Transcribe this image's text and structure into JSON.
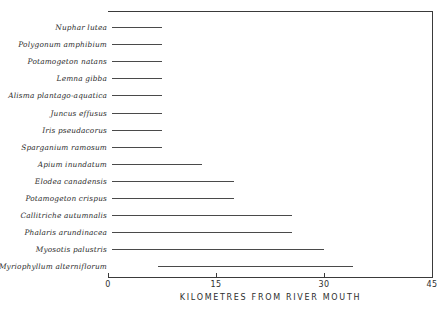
{
  "chart_data": {
    "type": "bar",
    "orientation": "horizontal",
    "title": "",
    "subtitle": "",
    "xlabel": "KILOMETRES FROM RIVER MOUTH",
    "ylabel": "",
    "xlim": [
      0,
      48
    ],
    "xticks": [
      0,
      15,
      30,
      45
    ],
    "xticklabels": [
      "0",
      "15",
      "30",
      "45"
    ],
    "grid": false,
    "legend": null,
    "bar_color": "#4a4a4a",
    "axis_color": "#3a3a3a",
    "note": "Each species is drawn as a horizontal range bar spanning its recorded distance interval from the river mouth.",
    "categories": [
      "Nuphar lutea",
      "Polygonum amphibium",
      "Potamogeton natans",
      "Lemna gibba",
      "Alisma plantago-aquatica",
      "Juncus effusus",
      "Iris pseudacorus",
      "Sparganium ramosum",
      "Apium inundatum",
      "Elodea canadensis",
      "Potamogeton crispus",
      "Callitriche autumnalis",
      "Phalaris arundinacea",
      "Myosotis palustris",
      "Myriophyllum alterniflorum"
    ],
    "ranges": [
      {
        "label": "Nuphar lutea",
        "start": 0.5,
        "end": 7.5
      },
      {
        "label": "Polygonum amphibium",
        "start": 0.5,
        "end": 7.5
      },
      {
        "label": "Potamogeton natans",
        "start": 0.5,
        "end": 7.5
      },
      {
        "label": "Lemna gibba",
        "start": 0.5,
        "end": 7.5
      },
      {
        "label": "Alisma plantago-aquatica",
        "start": 0.5,
        "end": 7.5
      },
      {
        "label": "Juncus effusus",
        "start": 0.5,
        "end": 7.5
      },
      {
        "label": "Iris pseudacorus",
        "start": 0.5,
        "end": 7.5
      },
      {
        "label": "Sparganium ramosum",
        "start": 0.5,
        "end": 7.5
      },
      {
        "label": "Apium inundatum",
        "start": 0.5,
        "end": 13.0
      },
      {
        "label": "Elodea canadensis",
        "start": 0.5,
        "end": 17.5
      },
      {
        "label": "Potamogeton crispus",
        "start": 0.5,
        "end": 17.5
      },
      {
        "label": "Callitriche autumnalis",
        "start": 0.5,
        "end": 25.5
      },
      {
        "label": "Phalaris arundinacea",
        "start": 0.5,
        "end": 25.5
      },
      {
        "label": "Myosotis palustris",
        "start": 0.5,
        "end": 30.0
      },
      {
        "label": "Myriophyllum alterniflorum",
        "start": 7.0,
        "end": 34.0
      }
    ]
  }
}
